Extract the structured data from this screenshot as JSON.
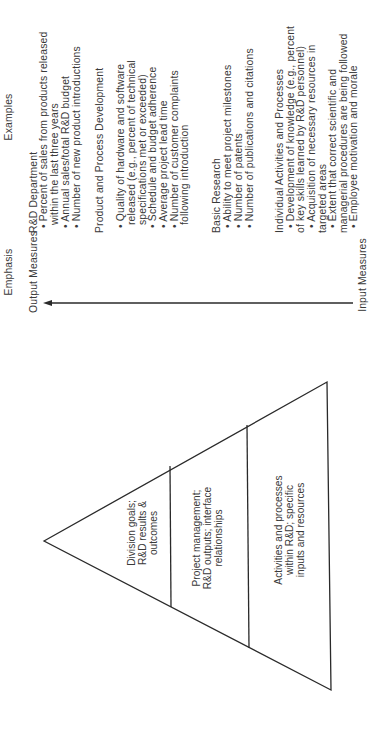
{
  "header": {
    "examples_title": "Examples",
    "emphasis_title": "Emphasis"
  },
  "axis": {
    "top_label": "Output Measures",
    "bottom_label": "Input Measures",
    "direction": "arrow points toward Output Measures"
  },
  "pyramid": {
    "tiers": [
      {
        "lines": [
          "Division goals;",
          "R&D results &",
          "outcomes"
        ]
      },
      {
        "lines": [
          "Project management;",
          "R&D outputs; interface",
          "relationships"
        ]
      },
      {
        "lines": [
          "Activities and processes",
          "within R&D; specific",
          "inputs and resources"
        ]
      }
    ]
  },
  "examples": {
    "groups": [
      {
        "heading": "R&D Department",
        "lines": [
          {
            "type": "bullet",
            "text": "• Percent of sales from products released"
          },
          {
            "type": "cont",
            "text": "within the last three years"
          },
          {
            "type": "bullet",
            "text": "• Annual sales/total R&D budget"
          },
          {
            "type": "bullet",
            "text": "• Number of new product introductions"
          }
        ]
      },
      {
        "heading": "Product and Process Development",
        "lines": [
          {
            "type": "bullet",
            "text": "• Quality of hardware and software"
          },
          {
            "type": "cont",
            "text": "released (e.g., percent of technical"
          },
          {
            "type": "cont",
            "text": "specifications met or exceeded)"
          },
          {
            "type": "bullet",
            "text": "• Schedule and budget adherence"
          },
          {
            "type": "bullet",
            "text": "• Average project lead time"
          },
          {
            "type": "bullet",
            "text": "• Number of customer complaints"
          },
          {
            "type": "cont",
            "text": "following introduction"
          }
        ]
      },
      {
        "heading": "Basic Research",
        "lines": [
          {
            "type": "bullet",
            "text": "• Ability to meet project milestones"
          },
          {
            "type": "bullet",
            "text": "• Number of patents"
          },
          {
            "type": "bullet",
            "text": "• Number of publications and citations"
          }
        ]
      },
      {
        "heading": "Individual Activities and Processes",
        "lines": [
          {
            "type": "bullet",
            "text": "• Development of knowledge (e.g., percent"
          },
          {
            "type": "flush",
            "text": "of  key skills learned by R&D personnel)"
          },
          {
            "type": "bullet",
            "text": "• Acquisition of necessary resources in"
          },
          {
            "type": "flush",
            "text": "targeted areas"
          },
          {
            "type": "bullet",
            "text": "• Extent that correct scientific and"
          },
          {
            "type": "flush",
            "text": "managerial procedures are being followed"
          },
          {
            "type": "bullet",
            "text": "• Employee motivation and morale"
          }
        ]
      }
    ]
  },
  "colors": {
    "background": "#ffffff",
    "ink": "#2a2a2a",
    "text": "#3a3a3a"
  }
}
